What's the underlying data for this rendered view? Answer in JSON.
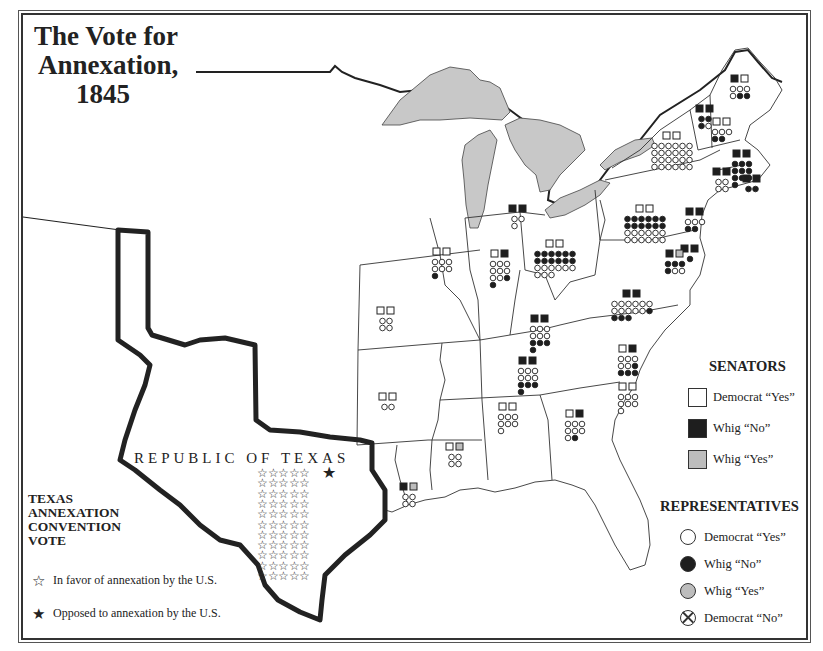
{
  "title": {
    "line1": "The Vote for",
    "line2": "Annexation,",
    "line3": "1845"
  },
  "texas": {
    "label": "REPUBLIC OF TEXAS",
    "legend_title": [
      "TEXAS",
      "ANNEXATION",
      "CONVENTION",
      "VOTE"
    ],
    "in_favor": {
      "glyph": "☆",
      "icon": "outline-star-icon",
      "label": "In favor of annexation by the U.S.",
      "count": 55
    },
    "opposed": {
      "glyph": "★",
      "icon": "filled-star-icon",
      "label": "Opposed to annexation by the U.S.",
      "count": 1
    }
  },
  "legend": {
    "senators": {
      "title": "SENATORS",
      "items": [
        {
          "key": "dem_yes",
          "label": "Democrat “Yes”",
          "fill": "#ffffff"
        },
        {
          "key": "whig_no",
          "label": "Whig “No”",
          "fill": "#1e1e1e"
        },
        {
          "key": "whig_yes",
          "label": "Whig “Yes”",
          "fill": "#bdbdbd"
        }
      ]
    },
    "representatives": {
      "title": "REPRESENTATIVES",
      "items": [
        {
          "key": "dem_yes",
          "label": "Democrat “Yes”",
          "fill": "#ffffff"
        },
        {
          "key": "whig_no",
          "label": "Whig “No”",
          "fill": "#1e1e1e"
        },
        {
          "key": "whig_yes",
          "label": "Whig “Yes”",
          "fill": "#bdbdbd"
        },
        {
          "key": "dem_no",
          "label": "Democrat “No”",
          "fill": "#ffffff",
          "crossed": true
        }
      ]
    }
  },
  "colors": {
    "ink": "#222222",
    "lake": "#c8c8c8",
    "whig_yes": "#bdbdbd",
    "whig_no": "#1e1e1e",
    "paper": "#ffffff"
  },
  "state_votes": [
    {
      "state": "Maine",
      "x": 740,
      "y": 75,
      "senators": [
        "whig_no",
        "dem_yes"
      ],
      "reps": {
        "dem_yes": 4,
        "whig_no": 2
      }
    },
    {
      "state": "New Hampshire",
      "x": 722,
      "y": 118,
      "senators": [
        "dem_yes",
        "dem_yes"
      ],
      "reps": {
        "dem_yes": 3,
        "whig_no": 2
      }
    },
    {
      "state": "Vermont",
      "x": 705,
      "y": 105,
      "senators": [
        "whig_no",
        "whig_no"
      ],
      "reps": {
        "whig_no": 3,
        "dem_yes": 1
      }
    },
    {
      "state": "Massachusetts",
      "x": 742,
      "y": 150,
      "senators": [
        "whig_no",
        "whig_no"
      ],
      "reps": {
        "whig_no": 10
      }
    },
    {
      "state": "Rhode Island",
      "x": 752,
      "y": 175,
      "senators": [
        "whig_no",
        "whig_no"
      ],
      "reps": {
        "whig_no": 2
      }
    },
    {
      "state": "Connecticut",
      "x": 722,
      "y": 168,
      "senators": [
        "whig_no",
        "whig_no"
      ],
      "reps": {
        "dem_yes": 4
      }
    },
    {
      "state": "New York",
      "x": 672,
      "y": 132,
      "senators": [
        "dem_yes",
        "dem_yes"
      ],
      "reps": {
        "dem_yes": 24
      }
    },
    {
      "state": "New Jersey",
      "x": 695,
      "y": 208,
      "senators": [
        "whig_no",
        "whig_no"
      ],
      "reps": {
        "dem_yes": 3,
        "whig_no": 2
      }
    },
    {
      "state": "Pennsylvania",
      "x": 645,
      "y": 205,
      "senators": [
        "dem_yes",
        "dem_yes"
      ],
      "reps": {
        "whig_no": 12,
        "dem_yes": 12
      }
    },
    {
      "state": "Delaware",
      "x": 690,
      "y": 245,
      "senators": [
        "whig_no",
        "whig_no"
      ],
      "reps": {
        "whig_no": 1
      }
    },
    {
      "state": "Maryland",
      "x": 675,
      "y": 250,
      "senators": [
        "whig_no",
        "whig_yes"
      ],
      "reps": {
        "whig_no": 4,
        "dem_yes": 2
      }
    },
    {
      "state": "Virginia",
      "x": 632,
      "y": 290,
      "senators": [
        "whig_no",
        "whig_no"
      ],
      "reps": {
        "dem_yes": 11,
        "whig_no": 4
      }
    },
    {
      "state": "North Carolina",
      "x": 628,
      "y": 345,
      "senators": [
        "dem_yes",
        "whig_no"
      ],
      "reps": {
        "dem_yes": 5,
        "whig_no": 4
      }
    },
    {
      "state": "South Carolina",
      "x": 628,
      "y": 383,
      "senators": [
        "dem_yes",
        "dem_yes"
      ],
      "reps": {
        "dem_yes": 7
      }
    },
    {
      "state": "Georgia",
      "x": 575,
      "y": 410,
      "senators": [
        "dem_yes",
        "whig_no"
      ],
      "reps": {
        "dem_yes": 7,
        "whig_no": 1
      }
    },
    {
      "state": "Ohio",
      "x": 555,
      "y": 240,
      "senators": [
        "dem_yes",
        "dem_yes"
      ],
      "reps": {
        "whig_no": 12,
        "dem_yes": 9
      }
    },
    {
      "state": "Michigan",
      "x": 518,
      "y": 205,
      "senators": [
        "whig_no",
        "whig_no"
      ],
      "reps": {
        "dem_yes": 3
      }
    },
    {
      "state": "Indiana",
      "x": 500,
      "y": 250,
      "senators": [
        "dem_yes",
        "whig_no"
      ],
      "reps": {
        "dem_yes": 8,
        "whig_no": 2
      }
    },
    {
      "state": "Illinois",
      "x": 442,
      "y": 248,
      "senators": [
        "dem_yes",
        "dem_yes"
      ],
      "reps": {
        "dem_yes": 6,
        "whig_no": 1
      }
    },
    {
      "state": "Kentucky",
      "x": 540,
      "y": 315,
      "senators": [
        "whig_no",
        "whig_no"
      ],
      "reps": {
        "dem_yes": 6,
        "whig_no": 4
      }
    },
    {
      "state": "Tennessee",
      "x": 528,
      "y": 357,
      "senators": [
        "whig_no",
        "whig_no"
      ],
      "reps": {
        "dem_yes": 6,
        "whig_no": 4
      }
    },
    {
      "state": "Missouri",
      "x": 386,
      "y": 307,
      "senators": [
        "dem_yes",
        "dem_yes"
      ],
      "reps": {
        "dem_yes": 4
      }
    },
    {
      "state": "Arkansas",
      "x": 388,
      "y": 393,
      "senators": [
        "dem_yes",
        "dem_yes"
      ],
      "reps": {
        "dem_yes": 2
      }
    },
    {
      "state": "Mississippi",
      "x": 455,
      "y": 443,
      "senators": [
        "dem_yes",
        "whig_yes"
      ],
      "reps": {
        "dem_yes": 4
      }
    },
    {
      "state": "Alabama",
      "x": 508,
      "y": 403,
      "senators": [
        "dem_yes",
        "dem_yes"
      ],
      "reps": {
        "dem_yes": 7
      }
    },
    {
      "state": "Louisiana",
      "x": 409,
      "y": 483,
      "senators": [
        "whig_no",
        "whig_yes"
      ],
      "reps": {
        "dem_yes": 4
      }
    }
  ]
}
